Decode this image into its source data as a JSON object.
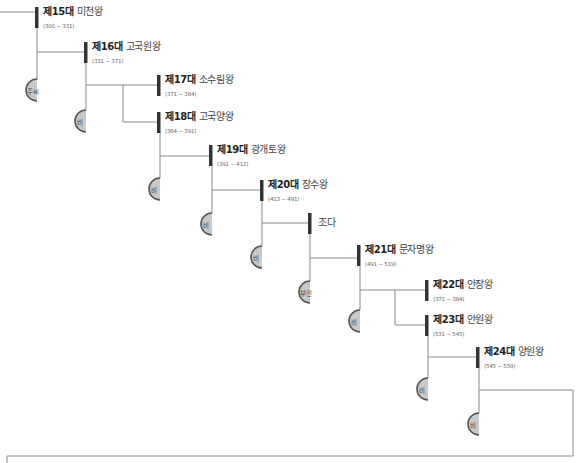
{
  "diagram": {
    "title": "",
    "colors": {
      "line": "#8a8a8a",
      "bar": "#333333",
      "spouse_fill": "#c9c9c9",
      "spouse_stroke": "#555555"
    },
    "kings": [
      {
        "num": "제15대",
        "name": "미천왕",
        "years": "(300 ~ 331)"
      },
      {
        "num": "제16대",
        "name": "고국원왕",
        "years": "(331 ~ 371)"
      },
      {
        "num": "제17대",
        "name": "소수림왕",
        "years": "(371 ~ 384)"
      },
      {
        "num": "제18대",
        "name": "고국양왕",
        "years": "(384 ~ 391)"
      },
      {
        "num": "제19대",
        "name": "광개토왕",
        "years": "(391 ~ 412)"
      },
      {
        "num": "제20대",
        "name": "장수왕",
        "years": "(413 ~ 491)"
      },
      {
        "num": "",
        "name": "조다",
        "years": ""
      },
      {
        "num": "제21대",
        "name": "문자명왕",
        "years": "(491 ~ 519)"
      },
      {
        "num": "제22대",
        "name": "안장왕",
        "years": "(371 ~ 384)"
      },
      {
        "num": "제23대",
        "name": "안원왕",
        "years": "(531 ~ 545)"
      },
      {
        "num": "제24대",
        "name": "양원왕",
        "years": "(545 ~ 559)"
      }
    ],
    "spouses": [
      "주씨",
      "비",
      "비",
      "비",
      "비",
      "부인",
      "비",
      "비",
      "비"
    ]
  }
}
